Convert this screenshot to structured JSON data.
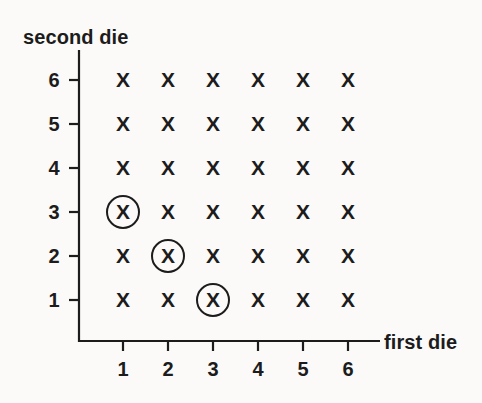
{
  "figure": {
    "background_color": "#fbfaf8",
    "ink_color": "#1c1c1c"
  },
  "axes": {
    "y_title": "second die",
    "x_title": "first die",
    "x_tick_labels": [
      "1",
      "2",
      "3",
      "4",
      "5",
      "6"
    ],
    "y_tick_labels": [
      "1",
      "2",
      "3",
      "4",
      "5",
      "6"
    ]
  },
  "chart_data": {
    "type": "scatter",
    "title": "",
    "xlabel": "first die",
    "ylabel": "second die",
    "xlim": [
      0,
      7
    ],
    "ylim": [
      0,
      7
    ],
    "xticks": [
      1,
      2,
      3,
      4,
      5,
      6
    ],
    "yticks": [
      1,
      2,
      3,
      4,
      5,
      6
    ],
    "grid": false,
    "legend": null,
    "marker": "x",
    "series": [
      {
        "name": "all outcomes",
        "marker": "x",
        "points": [
          {
            "x": 1,
            "y": 1
          },
          {
            "x": 2,
            "y": 1
          },
          {
            "x": 3,
            "y": 1
          },
          {
            "x": 4,
            "y": 1
          },
          {
            "x": 5,
            "y": 1
          },
          {
            "x": 6,
            "y": 1
          },
          {
            "x": 1,
            "y": 2
          },
          {
            "x": 2,
            "y": 2
          },
          {
            "x": 3,
            "y": 2
          },
          {
            "x": 4,
            "y": 2
          },
          {
            "x": 5,
            "y": 2
          },
          {
            "x": 6,
            "y": 2
          },
          {
            "x": 1,
            "y": 3
          },
          {
            "x": 2,
            "y": 3
          },
          {
            "x": 3,
            "y": 3
          },
          {
            "x": 4,
            "y": 3
          },
          {
            "x": 5,
            "y": 3
          },
          {
            "x": 6,
            "y": 3
          },
          {
            "x": 1,
            "y": 4
          },
          {
            "x": 2,
            "y": 4
          },
          {
            "x": 3,
            "y": 4
          },
          {
            "x": 4,
            "y": 4
          },
          {
            "x": 5,
            "y": 4
          },
          {
            "x": 6,
            "y": 4
          },
          {
            "x": 1,
            "y": 5
          },
          {
            "x": 2,
            "y": 5
          },
          {
            "x": 3,
            "y": 5
          },
          {
            "x": 4,
            "y": 5
          },
          {
            "x": 5,
            "y": 5
          },
          {
            "x": 6,
            "y": 5
          },
          {
            "x": 1,
            "y": 6
          },
          {
            "x": 2,
            "y": 6
          },
          {
            "x": 3,
            "y": 6
          },
          {
            "x": 4,
            "y": 6
          },
          {
            "x": 5,
            "y": 6
          },
          {
            "x": 6,
            "y": 6
          }
        ]
      },
      {
        "name": "highlighted outcomes (circled)",
        "marker": "circled-x",
        "points": [
          {
            "x": 1,
            "y": 3
          },
          {
            "x": 2,
            "y": 2
          },
          {
            "x": 3,
            "y": 1
          }
        ]
      }
    ]
  },
  "marks": {
    "glyph": "X"
  },
  "geometry": {
    "origin_x": 79,
    "origin_y": 341,
    "x_step": 45,
    "y_step": 44,
    "x_first": 123,
    "y_first": 300,
    "x_axis_end": 380,
    "y_axis_top": 50,
    "circle_radius": 17
  }
}
